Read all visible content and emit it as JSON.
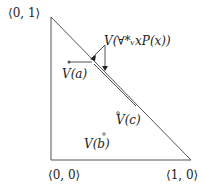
{
  "corners": {
    "top": "⟨0, 1⟩",
    "bottom_left": "⟨0, 0⟩",
    "bottom_right": "⟨1, 0⟩"
  },
  "points": {
    "a": "V(a)",
    "b": "V(b)",
    "c": "V(c)",
    "forall": "V(∀*ᵥxP(x))"
  }
}
